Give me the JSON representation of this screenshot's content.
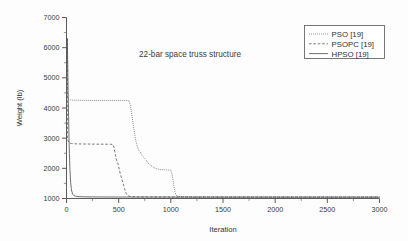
{
  "chart_data": {
    "type": "line",
    "title": "22-bar space truss structure",
    "xlabel": "Iteration",
    "ylabel": "Weight (lb)",
    "xlim": [
      0,
      3000
    ],
    "ylim": [
      1000,
      7000
    ],
    "xticks": [
      0,
      500,
      1000,
      1500,
      2000,
      2500,
      3000
    ],
    "xtick_labels": [
      "0",
      "500",
      "1000",
      "1500",
      "2000",
      "2500",
      "3000"
    ],
    "yticks": [
      1000,
      2000,
      3000,
      4000,
      5000,
      6000,
      7000
    ],
    "ytick_labels": [
      "1000",
      "2000",
      "3000",
      "4000",
      "5000",
      "6000",
      "7000"
    ],
    "xminor_step": 250,
    "yminor_step": 500,
    "grid": false,
    "legend_position": "top-right",
    "series": [
      {
        "name": "PSO [19]",
        "style": "dotted",
        "color": "#6b6b6b",
        "x": [
          8,
          8,
          20,
          40,
          60,
          120,
          240,
          400,
          560,
          600,
          612,
          625,
          640,
          655,
          668,
          680,
          690,
          700,
          712,
          720,
          735,
          750,
          765,
          780,
          800,
          820,
          840,
          870,
          900,
          940,
          975,
          1000,
          1012,
          1025,
          1040,
          1060,
          1200,
          1500,
          1800,
          2100,
          2400,
          2700,
          3000
        ],
        "y": [
          6300,
          4400,
          4300,
          4270,
          4260,
          4255,
          4250,
          4250,
          4250,
          4240,
          4100,
          3800,
          3450,
          3100,
          2850,
          2700,
          2620,
          2560,
          2520,
          2440,
          2380,
          2330,
          2260,
          2180,
          2120,
          2070,
          2020,
          1980,
          1960,
          1950,
          1945,
          1940,
          1800,
          1500,
          1200,
          1060,
          1050,
          1048,
          1047,
          1046,
          1046,
          1045,
          1045
        ]
      },
      {
        "name": "PSOPC [19]",
        "style": "dashed",
        "color": "#5f5f5f",
        "x": [
          8,
          8,
          18,
          30,
          50,
          100,
          200,
          320,
          420,
          445,
          455,
          462,
          470,
          478,
          486,
          494,
          500,
          508,
          515,
          522,
          530,
          540,
          548,
          556,
          565,
          575,
          590,
          620,
          700,
          900,
          1200,
          1600,
          2000,
          2400,
          2800,
          3000
        ],
        "y": [
          6300,
          3000,
          2880,
          2840,
          2820,
          2810,
          2805,
          2800,
          2800,
          2790,
          2700,
          2560,
          2420,
          2300,
          2220,
          2150,
          2060,
          1930,
          1820,
          1740,
          1650,
          1540,
          1430,
          1330,
          1230,
          1150,
          1090,
          1060,
          1052,
          1050,
          1048,
          1047,
          1046,
          1046,
          1045,
          1045
        ]
      },
      {
        "name": "HPSO [19]",
        "style": "solid",
        "color": "#555555",
        "x": [
          8,
          8,
          12,
          16,
          20,
          24,
          28,
          32,
          36,
          40,
          46,
          52,
          60,
          70,
          85,
          110,
          160,
          250,
          400,
          700,
          1000,
          1400,
          1800,
          2200,
          2600,
          3000
        ],
        "y": [
          6300,
          6250,
          5400,
          4500,
          3700,
          3000,
          2500,
          2050,
          1750,
          1520,
          1330,
          1220,
          1140,
          1100,
          1075,
          1062,
          1056,
          1052,
          1050,
          1048,
          1047,
          1046,
          1046,
          1045,
          1045,
          1045
        ]
      }
    ]
  }
}
